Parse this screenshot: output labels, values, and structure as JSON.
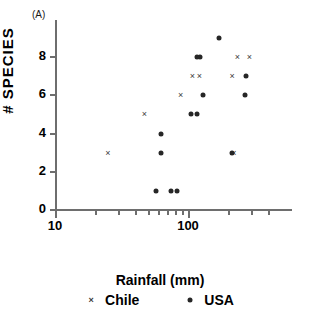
{
  "panel": {
    "label": "(A)"
  },
  "chart_data": {
    "type": "scatter",
    "title": "",
    "xlabel": "Rainfall (mm)",
    "ylabel": "# SPECIES",
    "xscale": "log",
    "yscale": "linear",
    "xlim": [
      10,
      400
    ],
    "ylim": [
      0,
      9.5
    ],
    "grid": false,
    "legend_position": "bottom",
    "x_ticks_major": [
      {
        "value": 10,
        "label": "10"
      },
      {
        "value": 100,
        "label": "100"
      }
    ],
    "x_ticks_minor": [
      20,
      30,
      40,
      50,
      60,
      70,
      80,
      90,
      200,
      300,
      400
    ],
    "y_ticks": [
      {
        "value": 0,
        "label": "0"
      },
      {
        "value": 2,
        "label": "2"
      },
      {
        "value": 4,
        "label": "4"
      },
      {
        "value": 6,
        "label": "6"
      },
      {
        "value": 8,
        "label": "8"
      }
    ],
    "series": [
      {
        "name": "Chile",
        "marker": "x",
        "color": "#3a3a3a",
        "points": [
          {
            "x": 25,
            "y": 3
          },
          {
            "x": 47,
            "y": 5
          },
          {
            "x": 88,
            "y": 6
          },
          {
            "x": 108,
            "y": 7
          },
          {
            "x": 122,
            "y": 7
          },
          {
            "x": 118,
            "y": 8
          },
          {
            "x": 215,
            "y": 7
          },
          {
            "x": 221,
            "y": 3
          },
          {
            "x": 235,
            "y": 8
          },
          {
            "x": 290,
            "y": 8
          }
        ]
      },
      {
        "name": "USA",
        "marker": "dot",
        "color": "#262626",
        "points": [
          {
            "x": 57,
            "y": 1
          },
          {
            "x": 74,
            "y": 1
          },
          {
            "x": 83,
            "y": 1
          },
          {
            "x": 63,
            "y": 4
          },
          {
            "x": 63,
            "y": 3
          },
          {
            "x": 105,
            "y": 5
          },
          {
            "x": 116,
            "y": 5
          },
          {
            "x": 130,
            "y": 6
          },
          {
            "x": 124,
            "y": 8
          },
          {
            "x": 116,
            "y": 8
          },
          {
            "x": 172,
            "y": 9
          },
          {
            "x": 216,
            "y": 3
          },
          {
            "x": 272,
            "y": 7
          },
          {
            "x": 270,
            "y": 6
          }
        ]
      }
    ]
  },
  "legend": {
    "items": [
      {
        "label": "Chile",
        "marker": "x"
      },
      {
        "label": "USA",
        "marker": "dot"
      }
    ]
  }
}
